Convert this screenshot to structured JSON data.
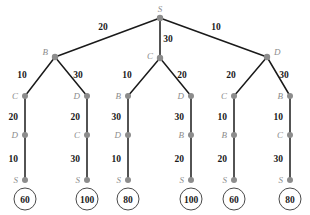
{
  "diagram": {
    "colors": {
      "node": "#8c8c8c",
      "edge": "#1a1a1a",
      "label": "#1a1a1a",
      "circle_stroke": "#4a4a4a",
      "background": "#ffffff"
    },
    "root": {
      "label": "S",
      "x": 160,
      "y": 18
    },
    "level2": [
      {
        "label": "B",
        "x": 55,
        "y": 57,
        "edge_cost": "20",
        "edge_label_x": 103,
        "edge_label_y": 30
      },
      {
        "label": "C",
        "x": 160,
        "y": 58,
        "edge_cost": "30",
        "edge_label_x": 168,
        "edge_label_y": 42
      },
      {
        "label": "D",
        "x": 267,
        "y": 57,
        "edge_cost": "10",
        "edge_label_x": 216,
        "edge_label_y": 30
      }
    ],
    "level3": [
      {
        "label": "C",
        "x": 25,
        "y": 96,
        "edge_cost": "10",
        "edge_label_x": 22,
        "edge_label_y": 78,
        "parent": 0
      },
      {
        "label": "D",
        "x": 87,
        "y": 96,
        "edge_cost": "30",
        "edge_label_x": 78,
        "edge_label_y": 78,
        "parent": 0
      },
      {
        "label": "B",
        "x": 128,
        "y": 96,
        "edge_cost": "10",
        "edge_label_x": 127,
        "edge_label_y": 78,
        "parent": 1
      },
      {
        "label": "D",
        "x": 191,
        "y": 96,
        "edge_cost": "20",
        "edge_label_x": 182,
        "edge_label_y": 78,
        "parent": 1
      },
      {
        "label": "C",
        "x": 234,
        "y": 96,
        "edge_cost": "20",
        "edge_label_x": 231,
        "edge_label_y": 78,
        "parent": 2
      },
      {
        "label": "B",
        "x": 290,
        "y": 96,
        "edge_cost": "30",
        "edge_label_x": 284,
        "edge_label_y": 78,
        "parent": 2
      }
    ],
    "columns": [
      {
        "x": 25,
        "mid": {
          "label": "D",
          "y": 135
        },
        "leaf": {
          "label": "S",
          "y": 180
        },
        "cost_top": "20",
        "cost_bottom": "10",
        "value": "60",
        "circle_y": 199
      },
      {
        "x": 87,
        "mid": {
          "label": "C",
          "y": 135
        },
        "leaf": {
          "label": "S",
          "y": 180
        },
        "cost_top": "20",
        "cost_bottom": "30",
        "value": "100",
        "circle_y": 199
      },
      {
        "x": 128,
        "mid": {
          "label": "D",
          "y": 135
        },
        "leaf": {
          "label": "S",
          "y": 180
        },
        "cost_top": "30",
        "cost_bottom": "10",
        "value": "80",
        "circle_y": 199
      },
      {
        "x": 191,
        "mid": {
          "label": "B",
          "y": 135
        },
        "leaf": {
          "label": "S",
          "y": 180
        },
        "cost_top": "30",
        "cost_bottom": "20",
        "value": "100",
        "circle_y": 199
      },
      {
        "x": 234,
        "mid": {
          "label": "B",
          "y": 135
        },
        "leaf": {
          "label": "S",
          "y": 180
        },
        "cost_top": "10",
        "cost_bottom": "20",
        "value": "60",
        "circle_y": 199
      },
      {
        "x": 290,
        "mid": {
          "label": "C",
          "y": 135
        },
        "leaf": {
          "label": "S",
          "y": 180
        },
        "cost_top": "10",
        "cost_bottom": "30",
        "value": "80",
        "circle_y": 199
      }
    ]
  }
}
